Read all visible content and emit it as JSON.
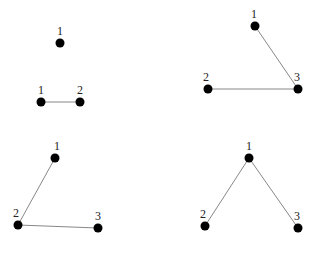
{
  "graphs": [
    {
      "name": "graph-a",
      "nodes": [
        {
          "id": "1",
          "x": 60,
          "y": 43,
          "lx": 57,
          "ly": 35
        },
        {
          "id": "1",
          "x": 41,
          "y": 102,
          "lx": 38,
          "ly": 94
        },
        {
          "id": "2",
          "x": 80,
          "y": 102,
          "lx": 77,
          "ly": 94
        }
      ],
      "edges": [
        [
          1,
          2
        ]
      ]
    },
    {
      "name": "graph-b",
      "nodes": [
        {
          "id": "1",
          "x": 255,
          "y": 26,
          "lx": 251,
          "ly": 18
        },
        {
          "id": "2",
          "x": 208,
          "y": 89,
          "lx": 203,
          "ly": 81
        },
        {
          "id": "3",
          "x": 298,
          "y": 89,
          "lx": 294,
          "ly": 81
        }
      ],
      "edges": [
        [
          0,
          2
        ],
        [
          1,
          2
        ]
      ]
    },
    {
      "name": "graph-c",
      "nodes": [
        {
          "id": "1",
          "x": 55,
          "y": 158,
          "lx": 54,
          "ly": 150
        },
        {
          "id": "2",
          "x": 18,
          "y": 225,
          "lx": 13,
          "ly": 217
        },
        {
          "id": "3",
          "x": 98,
          "y": 228,
          "lx": 95,
          "ly": 220
        }
      ],
      "edges": [
        [
          0,
          1
        ],
        [
          1,
          2
        ]
      ]
    },
    {
      "name": "graph-d",
      "nodes": [
        {
          "id": "1",
          "x": 249,
          "y": 158,
          "lx": 246,
          "ly": 150
        },
        {
          "id": "2",
          "x": 205,
          "y": 226,
          "lx": 200,
          "ly": 218
        },
        {
          "id": "3",
          "x": 298,
          "y": 228,
          "lx": 294,
          "ly": 220
        }
      ],
      "edges": [
        [
          0,
          1
        ],
        [
          0,
          2
        ]
      ]
    }
  ]
}
